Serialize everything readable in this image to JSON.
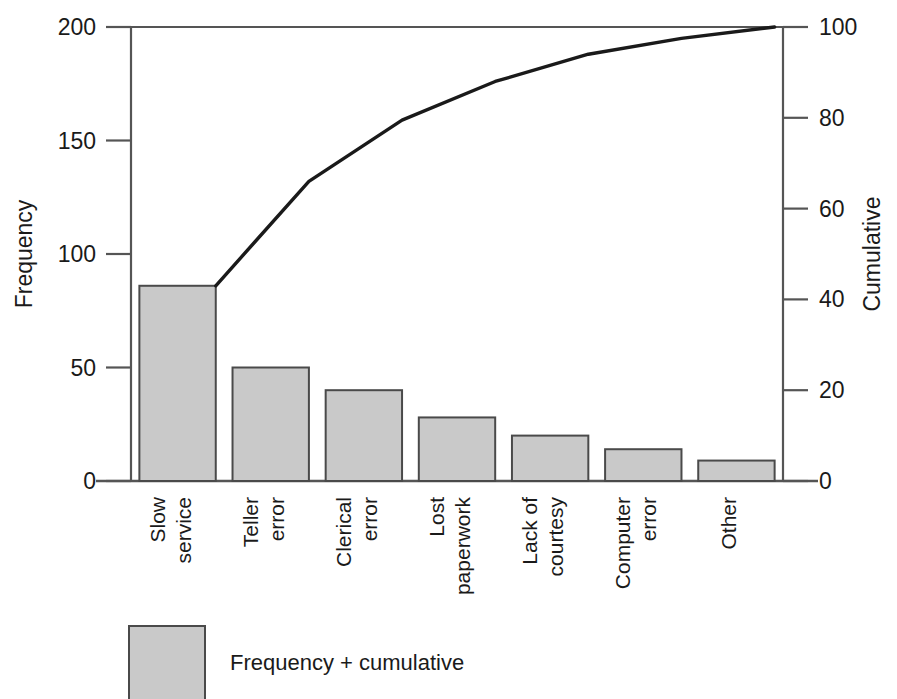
{
  "chart_data": {
    "type": "bar",
    "title": "",
    "subtitle": "",
    "categories": [
      "Slow service",
      "Teller error",
      "Clerical error",
      "Lost paperwork",
      "Lack of courtesy",
      "Computer error",
      "Other"
    ],
    "category_lines": [
      [
        "Slow",
        "service"
      ],
      [
        "Teller",
        "error"
      ],
      [
        "Clerical",
        "error"
      ],
      [
        "Lost",
        "paperwork"
      ],
      [
        "Lack of",
        "courtesy"
      ],
      [
        "Computer",
        "error"
      ],
      [
        "Other"
      ]
    ],
    "series": [
      {
        "name": "Frequency",
        "type": "bar",
        "values": [
          86,
          50,
          40,
          28,
          20,
          14,
          9
        ]
      },
      {
        "name": "Cumulative",
        "type": "line",
        "axis": "right",
        "values": [
          42.0,
          66.0,
          79.5,
          88.0,
          94.0,
          97.5,
          100.0
        ]
      }
    ],
    "xlabel": "",
    "ylabel": "Frequency",
    "y2label": "Cumulative",
    "ylim": [
      0,
      200
    ],
    "y2lim": [
      0,
      100
    ],
    "yticks": [
      "0",
      "50",
      "100",
      "150",
      "200"
    ],
    "ytick_values": [
      0,
      50,
      100,
      150,
      200
    ],
    "y2ticks": [
      "0",
      "20",
      "40",
      "60",
      "80",
      "100"
    ],
    "y2tick_values": [
      0,
      20,
      40,
      60,
      80,
      100
    ],
    "grid": false,
    "legend": {
      "position": "bottom-left",
      "entries": [
        {
          "label": "Frequency + cumulative",
          "swatch_color": "#c9c9c9"
        }
      ]
    },
    "colors": {
      "bar_fill": "#c9c9c9",
      "bar_stroke": "#4a4a4a",
      "line": "#1a1a1a",
      "axis": "#555555",
      "text": "#1a1a1a"
    }
  }
}
